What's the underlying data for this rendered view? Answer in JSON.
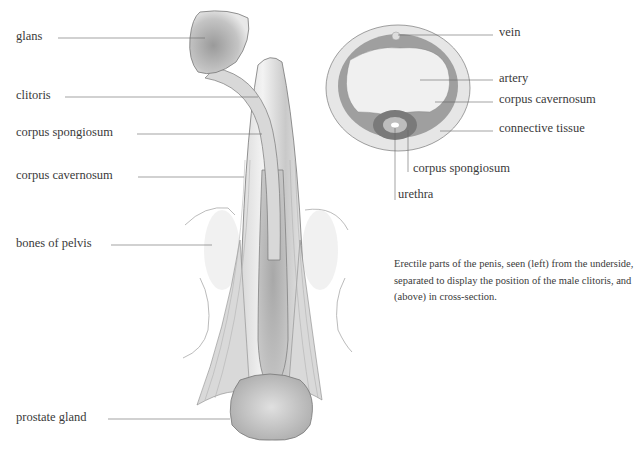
{
  "figure": {
    "left_view_labels": [
      {
        "id": "glans",
        "text": "glans"
      },
      {
        "id": "clitoris",
        "text": "clitoris"
      },
      {
        "id": "corpus-spongiosum",
        "text": "corpus spongiosum"
      },
      {
        "id": "corpus-cavernosum",
        "text": "corpus cavernosum"
      },
      {
        "id": "bones-of-pelvis",
        "text": "bones of pelvis"
      },
      {
        "id": "prostate-gland",
        "text": "prostate gland"
      }
    ],
    "cross_section_labels": [
      {
        "id": "vein",
        "text": "vein"
      },
      {
        "id": "artery",
        "text": "artery"
      },
      {
        "id": "corpus-cavernosum",
        "text": "corpus cavernosum"
      },
      {
        "id": "connective-tissue",
        "text": "connective tissue"
      },
      {
        "id": "corpus-spongiosum",
        "text": "corpus spongiosum"
      },
      {
        "id": "urethra",
        "text": "urethra"
      }
    ],
    "caption": "Erectile parts of the penis, seen (left) from the underside, separated to display the position of the male clitoris, and (above) in cross-section."
  }
}
